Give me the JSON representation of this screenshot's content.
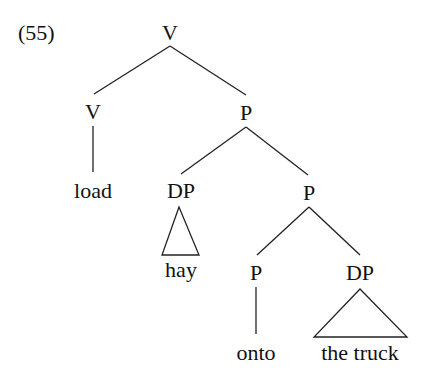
{
  "example_number": "(55)",
  "nodes": {
    "root": "V",
    "v_head": "V",
    "p_top": "P",
    "load": "load",
    "dp_hay": "DP",
    "p_mid": "P",
    "hay": "hay",
    "p_head": "P",
    "dp_truck": "DP",
    "onto": "onto",
    "the_truck": "the truck"
  }
}
